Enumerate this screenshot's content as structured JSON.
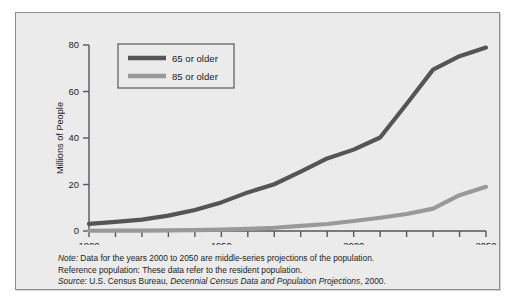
{
  "figure": {
    "background_color": "#ebebeb",
    "border_color": "#8e8e8e"
  },
  "caption": {
    "note_label": "Note:",
    "note_text": "  Data for the years 2000 to 2050 are middle-series projections of the population.",
    "reference_label": "Reference population:",
    "reference_text": "  These data refer to the resident population.",
    "source_label": "Source:",
    "source_text_plain": "  U.S. Census Bureau, ",
    "source_text_italic": "Decennial Census Data and Population Projections",
    "source_text_end": ", 2000."
  },
  "chart_data": {
    "type": "line",
    "title": "",
    "xlabel": "",
    "ylabel": "Millions of People",
    "xlim": [
      1900,
      2050
    ],
    "ylim": [
      0,
      80
    ],
    "yticks": [
      0,
      20,
      40,
      60,
      80
    ],
    "ytick_labels": [
      "0",
      "20",
      "40",
      "60",
      "80"
    ],
    "xticks": [
      1900,
      1910,
      1920,
      1930,
      1940,
      1950,
      1960,
      1970,
      1980,
      1990,
      2000,
      2010,
      2020,
      2030,
      2040,
      2050
    ],
    "xtick_labels_shown": [
      {
        "value": 1900,
        "label": "1900"
      },
      {
        "value": 1950,
        "label": "1950"
      },
      {
        "value": 2000,
        "label": "2000"
      },
      {
        "value": 2050,
        "label": "2050"
      }
    ],
    "grid": false,
    "legend_position": "top-left-inside",
    "x": [
      1900,
      1910,
      1920,
      1930,
      1940,
      1950,
      1960,
      1970,
      1980,
      1990,
      2000,
      2010,
      2020,
      2030,
      2040,
      2050
    ],
    "series": [
      {
        "name": "65 or older",
        "color": "#555555",
        "values": [
          3.1,
          3.9,
          4.9,
          6.6,
          9.0,
          12.3,
          16.6,
          20.1,
          25.5,
          31.2,
          35.0,
          40.2,
          54.6,
          69.4,
          75.2,
          78.9
        ]
      },
      {
        "name": "85 or older",
        "color": "#999999",
        "values": [
          0.1,
          0.2,
          0.2,
          0.3,
          0.4,
          0.6,
          0.9,
          1.4,
          2.2,
          3.0,
          4.3,
          5.7,
          7.3,
          9.6,
          15.4,
          19.0
        ]
      }
    ]
  }
}
